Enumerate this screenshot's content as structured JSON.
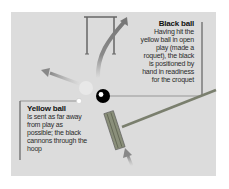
{
  "diagram": {
    "background": "#dcdcdc",
    "labels": {
      "black_ball": {
        "title": "Black ball",
        "body": "Having hit the yellow ball in open play (made a roquet), the black is positioned by hand in readiness for the croquet"
      },
      "yellow_ball": {
        "title": "Yellow ball",
        "body": "Is sent as far away from play as possible; the black cannons through the hoop"
      }
    },
    "elements": [
      "hoop",
      "black-ball",
      "yellow-ball",
      "mallet",
      "yellow-ball-path-arrow",
      "black-ball-path-arrow",
      "mallet-swing-arrow"
    ],
    "colors": {
      "black_ball": "#000000",
      "yellow_ball": "#ffffff",
      "mallet": "#7a7f6e",
      "arrow": "#8a8a8a",
      "leader_line": "#7a7a7a"
    }
  }
}
